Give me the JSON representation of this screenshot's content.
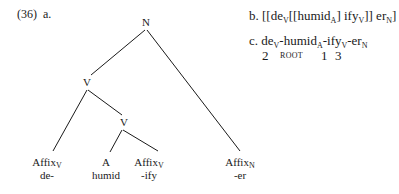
{
  "example": {
    "number": "(36)",
    "part_a_label": "a.",
    "part_b_label": "b.",
    "part_c_label": "c."
  },
  "tree": {
    "root": {
      "label": "N"
    },
    "v_upper": {
      "label": "V"
    },
    "v_lower": {
      "label": "V"
    },
    "leaves": [
      {
        "cat": "Affix",
        "sub": "V",
        "form": "de-"
      },
      {
        "cat": "A",
        "sub": "",
        "form": "humid"
      },
      {
        "cat": "Affix",
        "sub": "V",
        "form": "-ify"
      },
      {
        "cat": "Affix",
        "sub": "N",
        "form": "-er"
      }
    ]
  },
  "bracketing": {
    "open": "[[de",
    "sub1": "V",
    "mid1": "[[humid",
    "sub2": "A",
    "mid2": "] ify",
    "sub3": "V",
    "mid3": "]] er",
    "sub4": "N",
    "close": "]"
  },
  "linear": {
    "seg1": "de",
    "sub1": "V",
    "seg2": "-humid",
    "sub2": "A",
    "seg3": "-ify",
    "sub3": "V",
    "seg4": "-er",
    "sub4": "N",
    "order": [
      "2",
      "ROOT",
      "1",
      "3"
    ]
  }
}
